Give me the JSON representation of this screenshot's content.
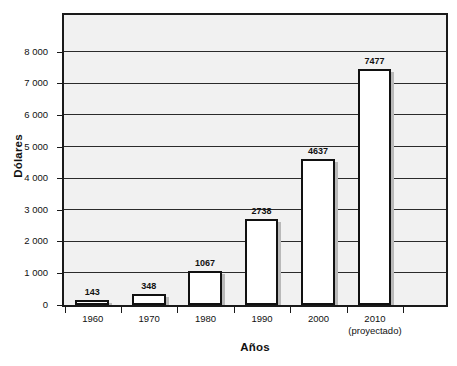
{
  "chart_data": {
    "type": "bar",
    "title": "",
    "xlabel": "Años",
    "ylabel": "Dólares",
    "categories": [
      "1960",
      "1970",
      "1980",
      "1990",
      "2000",
      "2010"
    ],
    "category_sublabels": [
      "",
      "",
      "",
      "",
      "",
      "(proyectado)"
    ],
    "values": [
      143,
      348,
      1067,
      2738,
      4637,
      7477
    ],
    "value_labels": [
      "143",
      "348",
      "1067",
      "2738",
      "4637",
      "7477"
    ],
    "ylim": [
      0,
      9150
    ],
    "ytick_values": [
      0,
      1000,
      2000,
      3000,
      4000,
      5000,
      6000,
      7000,
      8000
    ],
    "ytick_labels": [
      "0",
      "1 000",
      "2 000",
      "3 000",
      "4 000",
      "5 000",
      "6 000",
      "7 000",
      "8 000"
    ],
    "grid": true,
    "grid_axis": "y",
    "legend": false,
    "colors": {
      "bar_fill": "#ffffff",
      "bar_outline": "#111111",
      "bar_shadow": "#b9b9b9",
      "plot_background": "#f1f1f1",
      "plot_border": "#1a1a1a",
      "gridline": "#2b2b2b",
      "text": "#111111",
      "page_background": "#ffffff"
    }
  }
}
